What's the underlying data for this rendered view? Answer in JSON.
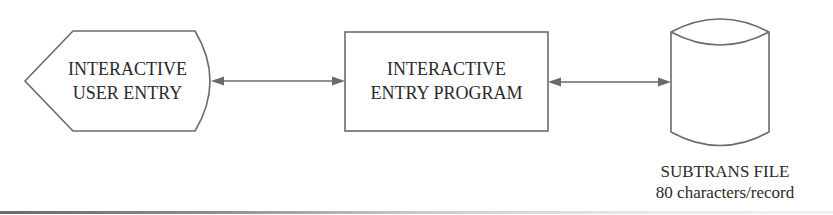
{
  "diagram": {
    "type": "flowchart",
    "nodes": [
      {
        "id": "user-entry",
        "shape": "display",
        "lines": [
          "INTERACTIVE",
          "USER ENTRY"
        ]
      },
      {
        "id": "entry-program",
        "shape": "process",
        "lines": [
          "INTERACTIVE",
          "ENTRY PROGRAM"
        ]
      },
      {
        "id": "subtrans-file",
        "shape": "cylinder",
        "caption": [
          "SUBTRANS FILE",
          "80 characters/record"
        ]
      }
    ],
    "edges": [
      {
        "from": "user-entry",
        "to": "entry-program",
        "direction": "bidirectional"
      },
      {
        "from": "entry-program",
        "to": "subtrans-file",
        "direction": "bidirectional"
      }
    ],
    "colors": {
      "stroke": "#6b6b6b",
      "text": "#2a2a2a",
      "background": "#ffffff"
    }
  }
}
